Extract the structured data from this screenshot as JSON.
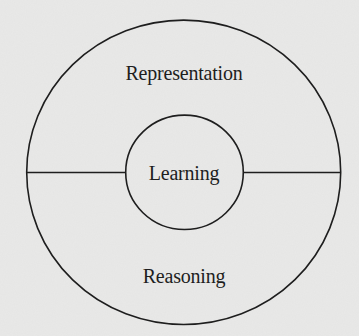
{
  "diagram": {
    "type": "concentric-circles",
    "outer_circle": {
      "label": "outer ring divided horizontally into two halves"
    },
    "regions": {
      "top": {
        "label": "Representation"
      },
      "center": {
        "label": "Learning"
      },
      "bottom": {
        "label": "Reasoning"
      }
    }
  },
  "colors": {
    "background": "#e9e9e8",
    "stroke": "#1e1e1e",
    "text": "#1e1e1e"
  }
}
